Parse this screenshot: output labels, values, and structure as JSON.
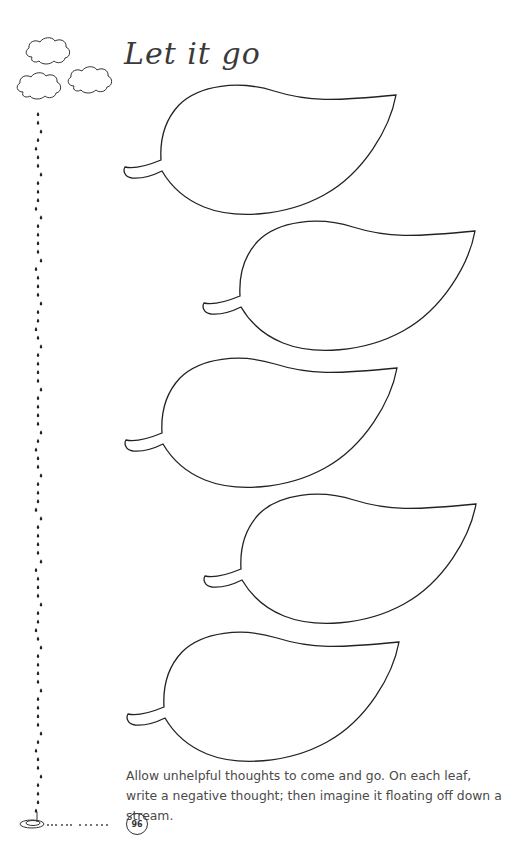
{
  "page": {
    "title": "Let it go",
    "instructions": "Allow unhelpful thoughts to come and go. On each leaf, write a negative thought; then imagine it floating off down a stream.",
    "page_number": "96"
  },
  "decorations": {
    "clouds": [
      {
        "name": "cloud-icon",
        "x": 24,
        "y": 36
      },
      {
        "name": "cloud-icon",
        "x": 15,
        "y": 75
      },
      {
        "name": "cloud-icon",
        "x": 66,
        "y": 65
      }
    ],
    "stream": {
      "x": 38,
      "start_y": 112,
      "end_y": 815,
      "puddle": {
        "x": 32,
        "y": 823
      }
    }
  },
  "leaves": [
    {
      "id": 1,
      "x": 124,
      "y": 83,
      "value": ""
    },
    {
      "id": 2,
      "x": 203,
      "y": 219,
      "value": ""
    },
    {
      "id": 3,
      "x": 125,
      "y": 356,
      "value": ""
    },
    {
      "id": 4,
      "x": 204,
      "y": 492,
      "value": ""
    },
    {
      "id": 5,
      "x": 127,
      "y": 630,
      "value": ""
    }
  ],
  "colors": {
    "line": "#222222",
    "text": "#4a4a4a"
  }
}
